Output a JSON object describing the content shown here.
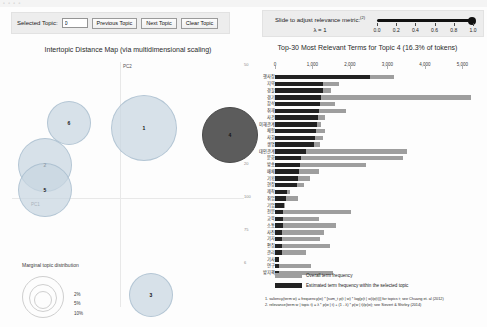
{
  "window": {
    "chrome_dots": "▫ ▫ ▫ ▫"
  },
  "topic_controls": {
    "selected_topic_label": "Selected Topic:",
    "selected_topic_value": "0",
    "previous_topic_label": "Previous Topic",
    "next_topic_label": "Next Topic",
    "clear_topic_label": "Clear Topic"
  },
  "lambda_controls": {
    "title": "Slide to adjust relevance metric:",
    "title_superscript": "(2)",
    "value_label": "λ = 1",
    "lambda": 1.0,
    "ticks": [
      "0.0",
      "0.2",
      "0.4",
      "0.6",
      "0.8",
      "1.0"
    ]
  },
  "mds": {
    "title": "Intertopic Distance Map (via multidimensional scaling)",
    "axis_x_name": "PC1",
    "axis_y_name": "PC2",
    "right_ticks": [
      "50",
      "",
      "",
      "20",
      "100",
      "75",
      "6"
    ],
    "topics": [
      {
        "label": "6",
        "cx": 61,
        "cy": 83,
        "r": 22,
        "selected": false
      },
      {
        "label": "1",
        "cx": 136,
        "cy": 88,
        "r": 33,
        "selected": false
      },
      {
        "label": "4",
        "cx": 222,
        "cy": 95,
        "r": 28,
        "selected": true
      },
      {
        "label": "2",
        "cx": 37,
        "cy": 125,
        "r": 27,
        "selected": false
      },
      {
        "label": "5",
        "cx": 37,
        "cy": 150,
        "r": 27,
        "selected": false
      },
      {
        "label": "3",
        "cx": 143,
        "cy": 255,
        "r": 22,
        "selected": false
      }
    ]
  },
  "marginal_legend": {
    "title": "Marginal topic distribution",
    "percents": [
      "2%",
      "5%",
      "10%"
    ]
  },
  "legend": {
    "overall_label": "Overall term frequency",
    "topic_label": "Estimated term frequency within the selected topic"
  },
  "footnotes": [
    "1. saliency(term w) = frequency(w) * [sum_t p(t | w) * log(p(t | w)/p(t))] for topics t; see Chuang et. al (2012)",
    "2. relevance(term w | topic t) = λ * p(w | t) + (1 - λ) * p(w | t)/p(w); see Sievert & Shirley (2014)"
  ],
  "chart_data": {
    "type": "bar",
    "title": "Top-30 Most Relevant Terms for Topic 4 (16.3% of tokens)",
    "orientation": "horizontal",
    "xlabel": "",
    "ylabel": "",
    "xlim": [
      0,
      5500
    ],
    "xticks": [
      0,
      1000,
      2000,
      3000,
      4000,
      5000
    ],
    "xtick_labels": [
      "0",
      "1,000",
      "2,000",
      "3,000",
      "4,000",
      "5,000"
    ],
    "grid": false,
    "legend_position": "bottom-left",
    "categories": [
      "행사장",
      "지역",
      "경찰",
      "경기",
      "참석",
      "취재",
      "사건",
      "이해관계",
      "체험",
      "사회",
      "생명",
      "대인관계",
      "문화",
      "방송",
      "매체",
      "기획",
      "현장",
      "제작",
      "취업",
      "기업",
      "전문",
      "교육",
      "소통",
      "사진",
      "기자",
      "편집",
      "관리",
      "기사",
      "연구",
      "방지책"
    ],
    "series": [
      {
        "name": "Overall term frequency",
        "values": [
          3180,
          1720,
          1500,
          5220,
          1610,
          1890,
          1340,
          1220,
          1330,
          1290,
          1200,
          3530,
          3420,
          2420,
          1180,
          930,
          780,
          390,
          620,
          260,
          2040,
          1180,
          1640,
          1300,
          1200,
          1480,
          830,
          120,
          950,
          1560
        ]
      },
      {
        "name": "Estimated term frequency within the selected topic",
        "values": [
          2540,
          1290,
          1280,
          1220,
          1200,
          1170,
          1160,
          1120,
          1090,
          1070,
          1030,
          830,
          690,
          660,
          640,
          620,
          600,
          330,
          290,
          230,
          220,
          210,
          205,
          200,
          195,
          190,
          185,
          110,
          105,
          100
        ]
      }
    ]
  }
}
